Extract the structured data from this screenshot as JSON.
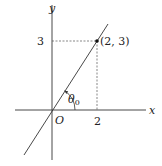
{
  "diagram": {
    "axes": {
      "x_label": "x",
      "y_label": "y",
      "origin_label": "O"
    },
    "ticks": {
      "x_tick": "2",
      "y_tick": "3"
    },
    "point": {
      "label": "(2, 3)",
      "x": 2,
      "y": 3
    },
    "angle": {
      "label_base": "θ",
      "label_sub": "0"
    },
    "line": {
      "description": "line through origin and (2, 3)",
      "slope": 1.5
    },
    "colors": {
      "stroke": "#333333",
      "dashed": "#555555",
      "background": "#ffffff"
    }
  }
}
